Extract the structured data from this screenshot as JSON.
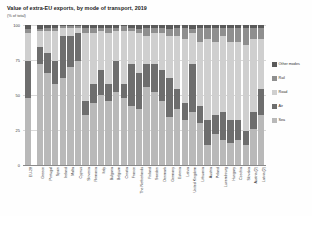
{
  "chart": {
    "title": "Value of extra-EU exports, by mode of transport, 2019",
    "subtitle": "(% of total)"
  },
  "legend": {
    "items": [
      {
        "label": "Other modes",
        "color": "#5a5a5a",
        "swatch_name": "legend-swatch-other-modes"
      },
      {
        "label": "Rail",
        "color": "#8f8f8f",
        "swatch_name": "legend-swatch-rail"
      },
      {
        "label": "Road",
        "color": "#cfcfcf",
        "swatch_name": "legend-swatch-road"
      },
      {
        "label": "Air",
        "color": "#6e6e6e",
        "swatch_name": "legend-swatch-air"
      },
      {
        "label": "Sea",
        "color": "#b9b9b9",
        "swatch_name": "legend-swatch-sea"
      }
    ]
  },
  "chart_data": {
    "type": "bar",
    "stacked": true,
    "stack_mode": "percent",
    "title": "Value of extra-EU exports, by mode of transport, 2019",
    "subtitle": "(% of total)",
    "xlabel": "",
    "ylabel": "",
    "ylim": [
      0,
      100
    ],
    "yticks": [
      0,
      25,
      50,
      75,
      100
    ],
    "ytick_labels": [
      "0",
      "25",
      "50",
      "75",
      "100"
    ],
    "grid": true,
    "legend_position": "right",
    "categories": [
      "EU-28",
      "Greece",
      "Portugal",
      "Spain",
      "Ireland",
      "Malta",
      "Cyprus",
      "Slovenia",
      "Romania",
      "Italy",
      "Bulgaria",
      "Belgium",
      "Croatia",
      "France",
      "The Netherlands",
      "Finland",
      "Sweden",
      "Denmark",
      "Germany",
      "Estonia",
      "Latvia",
      "United Kingdom",
      "Lithuania",
      "Austria",
      "Poland",
      "Luxembourg",
      "Hungary",
      "Czechia",
      "Slovakia",
      "Austria (2)",
      "Latvia (2)"
    ],
    "series": [
      {
        "name": "Sea",
        "color": "#b9b9b9",
        "values": [
          48,
          72,
          66,
          58,
          62,
          70,
          74,
          36,
          44,
          50,
          46,
          52,
          48,
          42,
          40,
          56,
          52,
          46,
          34,
          40,
          32,
          38,
          30,
          14,
          22,
          18,
          16,
          18,
          14,
          26,
          36
        ]
      },
      {
        "name": "Air",
        "color": "#6e6e6e",
        "values": [
          26,
          12,
          14,
          16,
          30,
          22,
          20,
          10,
          14,
          18,
          12,
          22,
          10,
          30,
          26,
          16,
          20,
          22,
          28,
          14,
          12,
          34,
          12,
          18,
          14,
          20,
          16,
          14,
          10,
          12,
          18
        ]
      },
      {
        "name": "Road",
        "color": "#cfcfcf",
        "values": [
          20,
          12,
          16,
          22,
          6,
          6,
          4,
          48,
          36,
          28,
          36,
          22,
          38,
          24,
          28,
          20,
          22,
          26,
          30,
          38,
          46,
          22,
          46,
          58,
          52,
          54,
          56,
          56,
          62,
          52,
          36
        ]
      },
      {
        "name": "Rail",
        "color": "#8f8f8f",
        "values": [
          3,
          1,
          2,
          2,
          1,
          1,
          1,
          4,
          4,
          2,
          4,
          2,
          3,
          2,
          3,
          6,
          4,
          4,
          5,
          6,
          8,
          3,
          10,
          8,
          10,
          6,
          10,
          10,
          12,
          8,
          8
        ]
      },
      {
        "name": "Other modes",
        "color": "#5a5a5a",
        "values": [
          3,
          3,
          2,
          2,
          1,
          1,
          1,
          2,
          2,
          2,
          2,
          2,
          1,
          2,
          3,
          2,
          2,
          2,
          3,
          2,
          2,
          3,
          2,
          2,
          2,
          2,
          2,
          2,
          2,
          2,
          2
        ]
      }
    ]
  }
}
